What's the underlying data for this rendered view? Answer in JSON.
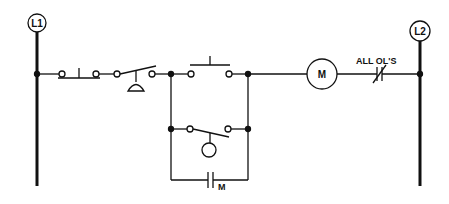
{
  "diagram": {
    "type": "ladder-diagram",
    "rails": {
      "left": {
        "label": "L1"
      },
      "right": {
        "label": "L2"
      }
    },
    "components": {
      "stop_button": {
        "type": "pushbutton-normally-closed"
      },
      "foot_switch": {
        "type": "foot-switch"
      },
      "start_button": {
        "type": "pushbutton-normally-open"
      },
      "float_switch": {
        "type": "float-switch"
      },
      "holding_contact": {
        "type": "normally-open-contact",
        "label": "M"
      },
      "motor_coil": {
        "type": "coil",
        "label": "M"
      },
      "overloads": {
        "type": "normally-closed-contact",
        "label": "ALL OL'S"
      }
    },
    "color": "#111111"
  }
}
